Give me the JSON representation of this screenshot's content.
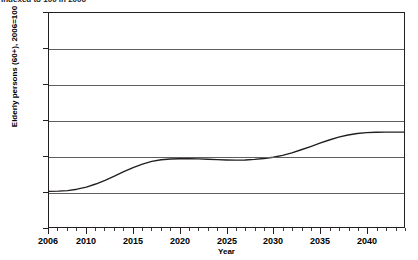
{
  "caption": {
    "text": "Indexed to 100 in 2006"
  },
  "axis_title": {
    "x": "Year",
    "y": "Elderly persons (60+), 2006=100"
  },
  "colors": {
    "line": "#231f20",
    "grid": "#5e5e5e",
    "frame": "#231f20",
    "background": "#ffffff"
  },
  "chart_data": {
    "type": "line",
    "title": "Indexed to 100 in 2006",
    "xlabel": "Year",
    "ylabel": "Elderly persons (60+), 2006=100",
    "xlim": [
      2006,
      2044
    ],
    "ylim": [
      80,
      200
    ],
    "ytick_labels": [
      "200",
      "180",
      "160",
      "140",
      "120",
      "100",
      "80"
    ],
    "yticks": [
      200,
      180,
      160,
      140,
      120,
      100,
      80
    ],
    "xtick_labels": [
      "2006",
      "2010",
      "2015",
      "2020",
      "2025",
      "2030",
      "2035",
      "2040"
    ],
    "xticks": [
      2006,
      2010,
      2015,
      2020,
      2025,
      2030,
      2035,
      2040
    ],
    "xtick_minor_step": 1,
    "grid": "horizontal",
    "legend": "none",
    "series": [
      {
        "name": "Elderly persons (60+), 2006=100",
        "x": [
          2006,
          2007,
          2008,
          2009,
          2010,
          2011,
          2012,
          2013,
          2014,
          2015,
          2016,
          2017,
          2018,
          2019,
          2020,
          2021,
          2022,
          2023,
          2024,
          2025,
          2026,
          2027,
          2028,
          2029,
          2030,
          2031,
          2032,
          2033,
          2034,
          2035,
          2036,
          2037,
          2038,
          2039,
          2040,
          2041,
          2042,
          2043,
          2044
        ],
        "values": [
          100.0,
          100.1,
          100.4,
          101.2,
          102.4,
          104.1,
          106.2,
          108.5,
          111.0,
          113.3,
          115.3,
          116.8,
          117.7,
          118.1,
          118.3,
          118.3,
          118.2,
          118.0,
          117.8,
          117.6,
          117.5,
          117.6,
          117.9,
          118.4,
          119.1,
          120.2,
          121.6,
          123.3,
          125.1,
          127.0,
          128.8,
          130.4,
          131.6,
          132.4,
          132.9,
          133.1,
          133.2,
          133.2,
          133.2
        ]
      }
    ]
  }
}
